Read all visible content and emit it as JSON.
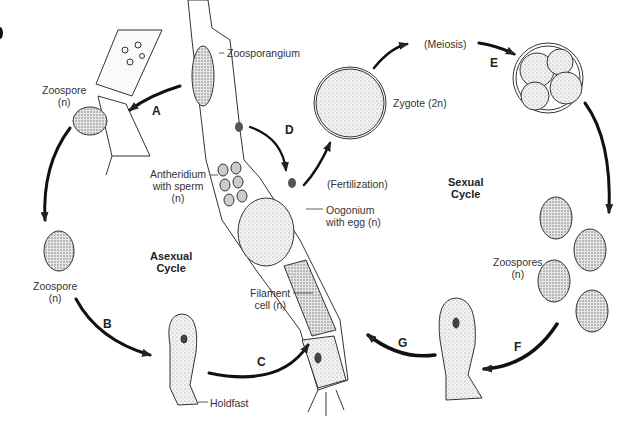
{
  "diagram": {
    "cycles": {
      "asexual": "Asexual\nCycle",
      "sexual": "Sexual\nCycle"
    },
    "labels": {
      "zoospore_top": "Zoospore",
      "zoospore_top_ploidy": "(n)",
      "zoospore_left": "Zoospore",
      "zoospore_left_ploidy": "(n)",
      "zoosporangium": "Zoosporangium",
      "antheridium_1": "Antheridium",
      "antheridium_2": "with sperm",
      "antheridium_3": "(n)",
      "oogonium_1": "Oogonium",
      "oogonium_2": "with egg (n)",
      "filament_1": "Filament",
      "filament_2": "cell (n)",
      "holdfast": "Holdfast",
      "fertilization": "(Fertilization)",
      "meiosis": "(Meiosis)",
      "zygote": "Zygote (2n)",
      "zoospores": "Zoospores",
      "zoospores_ploidy": "(n)",
      "asexual_1": "Asexual",
      "asexual_2": "Cycle",
      "sexual_1": "Sexual",
      "sexual_2": "Cycle"
    },
    "steps": [
      "A",
      "B",
      "C",
      "D",
      "E",
      "F",
      "G"
    ]
  }
}
